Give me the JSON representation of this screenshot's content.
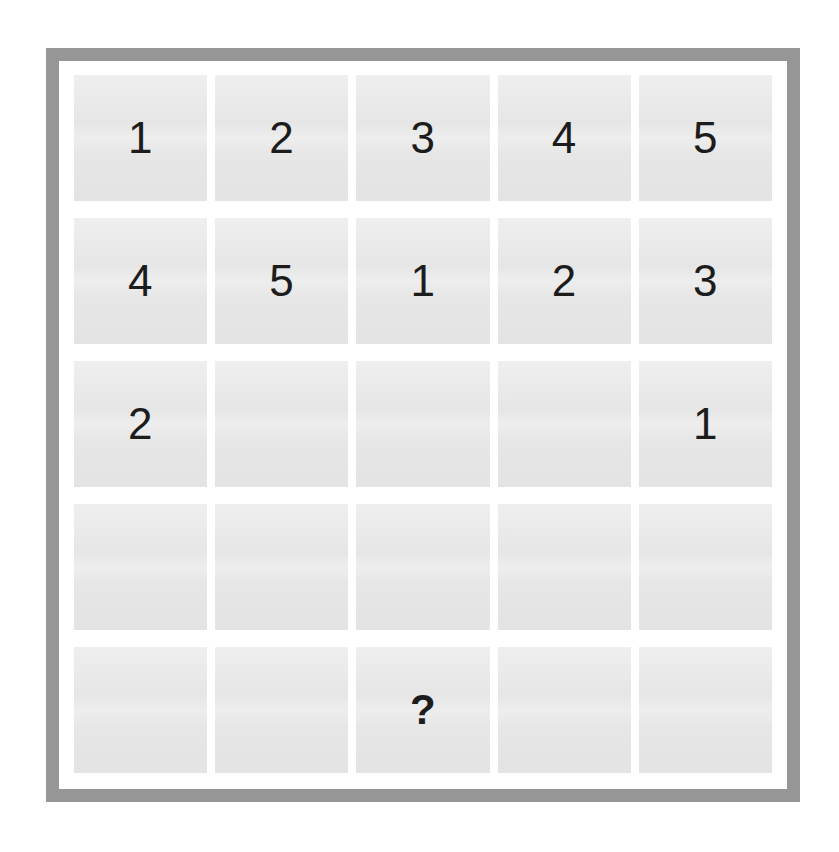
{
  "puzzle": {
    "kind": "number-grid-puzzle",
    "rows": 5,
    "columns": 5,
    "unknown_marker": "?",
    "empty_marker": "",
    "colors": {
      "page_background": "#ffffff",
      "frame_border": "#969696",
      "inner_background": "#ffffff",
      "cell_fill": "#e6e6e6",
      "digit_text": "#1c1c1c"
    },
    "cells": [
      [
        {
          "value": "1",
          "state": "filled"
        },
        {
          "value": "2",
          "state": "filled"
        },
        {
          "value": "3",
          "state": "filled"
        },
        {
          "value": "4",
          "state": "filled"
        },
        {
          "value": "5",
          "state": "filled"
        }
      ],
      [
        {
          "value": "4",
          "state": "filled"
        },
        {
          "value": "5",
          "state": "filled"
        },
        {
          "value": "1",
          "state": "filled"
        },
        {
          "value": "2",
          "state": "filled"
        },
        {
          "value": "3",
          "state": "filled"
        }
      ],
      [
        {
          "value": "2",
          "state": "filled"
        },
        {
          "value": "",
          "state": "empty"
        },
        {
          "value": "",
          "state": "empty"
        },
        {
          "value": "",
          "state": "empty"
        },
        {
          "value": "1",
          "state": "filled"
        }
      ],
      [
        {
          "value": "",
          "state": "empty"
        },
        {
          "value": "",
          "state": "empty"
        },
        {
          "value": "",
          "state": "empty"
        },
        {
          "value": "",
          "state": "empty"
        },
        {
          "value": "",
          "state": "empty"
        }
      ],
      [
        {
          "value": "",
          "state": "empty"
        },
        {
          "value": "",
          "state": "empty"
        },
        {
          "value": "?",
          "state": "unknown"
        },
        {
          "value": "",
          "state": "empty"
        },
        {
          "value": "",
          "state": "empty"
        }
      ]
    ]
  }
}
